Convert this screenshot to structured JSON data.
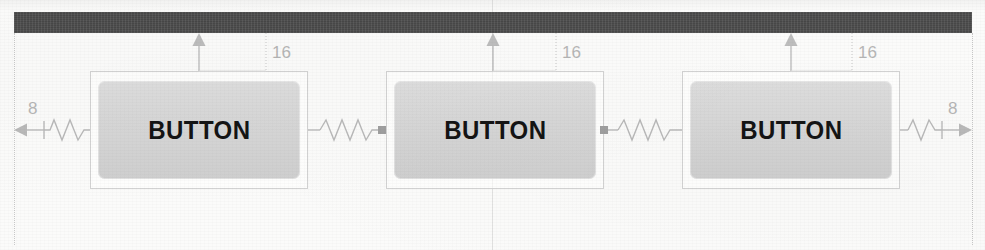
{
  "document": {
    "kind": "scanned-figure",
    "figure_title": "UI layout constraint diagram",
    "page_background": "#fbfbfa"
  },
  "canvas": {
    "width": 985,
    "height": 250
  },
  "parent_container": {
    "name": "parent-bar",
    "color": "#474747",
    "x": 14,
    "y": 12,
    "width": 958,
    "height": 21
  },
  "widgets": [
    {
      "id": "button-1",
      "label": "BUTTON",
      "outer_box": {
        "x": 90,
        "y": 71,
        "width": 218,
        "height": 118
      },
      "inner_button": {
        "x": 98,
        "y": 81,
        "width": 202,
        "height": 98,
        "fill": "#d6d6d6",
        "text_color": "#141414"
      }
    },
    {
      "id": "button-2",
      "label": "BUTTON",
      "outer_box": {
        "x": 386,
        "y": 71,
        "width": 218,
        "height": 118
      },
      "inner_button": {
        "x": 394,
        "y": 81,
        "width": 202,
        "height": 98,
        "fill": "#d6d6d6",
        "text_color": "#141414"
      }
    },
    {
      "id": "button-3",
      "label": "BUTTON",
      "outer_box": {
        "x": 682,
        "y": 71,
        "width": 218,
        "height": 118
      },
      "inner_button": {
        "x": 690,
        "y": 81,
        "width": 202,
        "height": 98,
        "fill": "#d6d6d6",
        "text_color": "#141414"
      }
    }
  ],
  "dimensions": {
    "color": "#b6b6b6",
    "top_margins": [
      {
        "id": "top-margin-1",
        "value": "16",
        "anchor_x": 199,
        "label_x": 272,
        "label_y": 44
      },
      {
        "id": "top-margin-2",
        "value": "16",
        "anchor_x": 493,
        "label_x": 562,
        "label_y": 44
      },
      {
        "id": "top-margin-3",
        "value": "16",
        "anchor_x": 791,
        "label_x": 858,
        "label_y": 44
      }
    ],
    "side_margins": [
      {
        "id": "left-margin",
        "value": "8",
        "label_x": 28,
        "label_y": 100,
        "direction": "left"
      },
      {
        "id": "right-margin",
        "value": "8",
        "label_x": 948,
        "label_y": 100,
        "direction": "right"
      }
    ]
  },
  "connectors": [
    {
      "id": "spring-left-edge",
      "type": "spring",
      "from_x": 14,
      "to_x": 90,
      "y": 130,
      "arrow": "left"
    },
    {
      "id": "spring-btn1-btn2",
      "type": "spring",
      "from_x": 308,
      "to_x": 386,
      "y": 130,
      "arrow": "none"
    },
    {
      "id": "spring-btn2-btn3",
      "type": "spring",
      "from_x": 604,
      "to_x": 682,
      "y": 130,
      "arrow": "none"
    },
    {
      "id": "spring-right-edge",
      "type": "spring",
      "from_x": 900,
      "to_x": 972,
      "y": 130,
      "arrow": "right"
    }
  ],
  "guides": [
    {
      "id": "guide-left",
      "x": 14,
      "style": "dotted"
    },
    {
      "id": "guide-right",
      "x": 972,
      "style": "dotted"
    },
    {
      "id": "guide-center",
      "x": 492,
      "style": "solid-faint"
    }
  ]
}
